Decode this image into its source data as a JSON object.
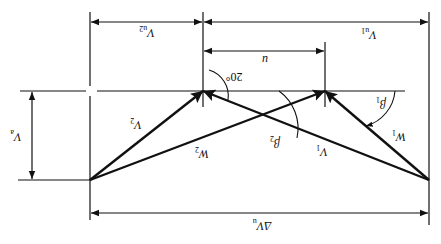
{
  "figure": {
    "orientation": "rotated-180deg",
    "type": "velocity-triangle",
    "colors": {
      "line": "#111111",
      "background": "#ffffff"
    }
  },
  "labels": {
    "vu2": {
      "main": "V",
      "sub": "u2"
    },
    "vu1": {
      "main": "V",
      "sub": "u1"
    },
    "u": {
      "main": "u"
    },
    "angle20": {
      "main": "20°"
    },
    "va": {
      "main": "V",
      "sub": "a"
    },
    "v2": {
      "main": "V",
      "sub": "2"
    },
    "w2": {
      "main": "W",
      "sub": "2"
    },
    "v1": {
      "main": "V",
      "sub": "1"
    },
    "w1": {
      "main": "W",
      "sub": "1"
    },
    "beta1": {
      "main": "β",
      "sub": "1"
    },
    "beta2": {
      "main": "β",
      "sub": "2"
    },
    "delta_vu": {
      "main": "ΔV",
      "sub": "u"
    }
  }
}
